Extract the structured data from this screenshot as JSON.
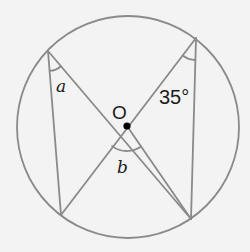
{
  "diagram": {
    "type": "circle-theorem",
    "colors": {
      "background": "#f3f3f3",
      "stroke": "#8a8a8a",
      "text": "#1a1a1a",
      "center_dot": "#000000"
    },
    "circle": {
      "cx": 128,
      "cy": 127,
      "r": 111
    },
    "center": {
      "label": "O",
      "x": 127,
      "y": 126
    },
    "points": {
      "top_left": {
        "x": 48,
        "y": 51
      },
      "top_right": {
        "x": 196,
        "y": 38
      },
      "bottom_left": {
        "x": 61,
        "y": 215
      },
      "bottom_right": {
        "x": 191,
        "y": 219
      }
    },
    "segments": [
      {
        "from": "top_left",
        "to": "bottom_left"
      },
      {
        "from": "top_left",
        "to": "bottom_right"
      },
      {
        "from": "bottom_left",
        "to": "top_right"
      },
      {
        "from": "top_right",
        "to": "bottom_right"
      },
      {
        "from": "center",
        "to": "bottom_right"
      }
    ],
    "angles": [
      {
        "name": "a",
        "label": "a",
        "vertex": "top_left",
        "value": null
      },
      {
        "name": "35",
        "label": "35°",
        "vertex": "top_right",
        "value": 35
      },
      {
        "name": "b",
        "label": "b",
        "vertex": "center",
        "value": null
      }
    ],
    "labels": {
      "angle_a": "a",
      "angle_35": "35°",
      "angle_b": "b",
      "center": "O"
    }
  }
}
